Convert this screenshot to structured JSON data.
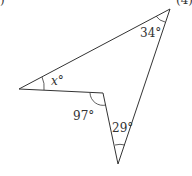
{
  "diagram": {
    "type": "concave quadrilateral (arrowhead)",
    "corner_text_left": ")",
    "corner_text_right": "(4)",
    "angles": {
      "top_right": "34°",
      "left": "x°",
      "reflex_inner": "97°",
      "bottom": "29°"
    },
    "stroke_color": "#333333"
  }
}
